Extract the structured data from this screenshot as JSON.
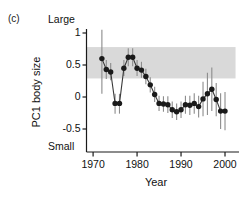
{
  "panel": {
    "letter": "(c)"
  },
  "axis": {
    "y_top_anchor": "Large",
    "y_bottom_anchor": "Small",
    "y_title": "PC1 body size",
    "x_title": "Year",
    "y_ticks": [
      "1",
      "0.5",
      "0",
      "-0.5"
    ],
    "y_tick_values": [
      1,
      0.5,
      0,
      -0.5
    ],
    "x_ticks": [
      "1970",
      "1980",
      "1990",
      "2000"
    ],
    "x_tick_values": [
      1970,
      1980,
      1990,
      2000
    ]
  },
  "style": {
    "band_color": "#d9d9d9",
    "point_color": "#1a1a1a",
    "line_color": "#3a3a3a",
    "error_color": "#8c8c8c",
    "axis_color": "#1a1a1a"
  },
  "chart_data": {
    "type": "line",
    "title": "",
    "xlabel": "Year",
    "ylabel": "PC1 body size",
    "xlim": [
      1968.5,
      2002.5
    ],
    "ylim": [
      -0.78,
      1.12
    ],
    "grid": false,
    "legend": "none",
    "annotations": [
      {
        "text": "(c)",
        "role": "panel-letter"
      },
      {
        "text": "Large",
        "role": "y-axis-top-anchor"
      },
      {
        "text": "Small",
        "role": "y-axis-bottom-anchor"
      },
      {
        "text": "shaded horizontal reference band",
        "role": "band",
        "y_range": [
          0.29,
          0.78
        ]
      }
    ],
    "band": {
      "y_low": 0.29,
      "y_high": 0.78,
      "x_low": 1968.6,
      "x_high": 2002.4
    },
    "series": [
      {
        "name": "PC1 body size",
        "x": [
          1972,
          1973,
          1974,
          1975,
          1976,
          1977,
          1978,
          1979,
          1980,
          1981,
          1982,
          1983,
          1984,
          1985,
          1986,
          1987,
          1988,
          1989,
          1990,
          1991,
          1992,
          1993,
          1994,
          1995,
          1996,
          1997,
          1998,
          1999,
          2000
        ],
        "values": [
          0.6,
          0.43,
          0.39,
          -0.1,
          -0.1,
          0.45,
          0.62,
          0.62,
          0.45,
          0.42,
          0.32,
          0.19,
          0.04,
          -0.1,
          -0.11,
          -0.12,
          -0.2,
          -0.23,
          -0.2,
          -0.12,
          -0.13,
          -0.1,
          -0.15,
          -0.03,
          0.05,
          0.12,
          -0.04,
          -0.22,
          -0.22
        ],
        "err_low": [
          0.05,
          0.28,
          0.26,
          -0.26,
          -0.26,
          0.33,
          0.48,
          0.48,
          0.33,
          0.3,
          0.2,
          0.07,
          -0.08,
          -0.22,
          -0.23,
          -0.25,
          -0.33,
          -0.36,
          -0.33,
          -0.26,
          -0.28,
          -0.26,
          -0.32,
          -0.3,
          -0.28,
          -0.22,
          -0.3,
          -0.5,
          -0.52
        ],
        "err_high": [
          1.05,
          0.58,
          0.53,
          0.05,
          0.05,
          0.58,
          0.76,
          0.76,
          0.58,
          0.55,
          0.44,
          0.31,
          0.16,
          0.02,
          0.01,
          0.01,
          -0.07,
          -0.1,
          -0.07,
          0.02,
          0.02,
          0.06,
          0.02,
          0.24,
          0.38,
          0.46,
          0.22,
          0.06,
          0.08
        ]
      }
    ]
  }
}
